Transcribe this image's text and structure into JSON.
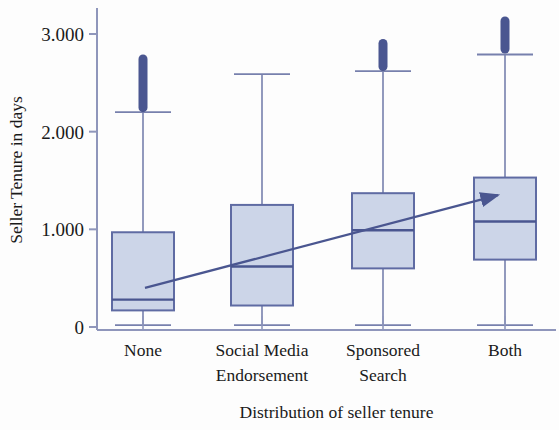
{
  "chart_data": {
    "type": "box",
    "title": "",
    "xlabel": "Distribution of seller tenure",
    "ylabel": "Seller Tenure in days",
    "categories": [
      "None",
      "Social Media Endorsement",
      "Sponsored Search",
      "Both"
    ],
    "category_lines": [
      [
        "None"
      ],
      [
        "Social Media",
        "Endorsement"
      ],
      [
        "Sponsored",
        "Search"
      ],
      [
        "Both"
      ]
    ],
    "ylim": [
      0,
      3200
    ],
    "yticks": [
      0,
      1000,
      2000,
      3000
    ],
    "ytick_labels": [
      "0",
      "1.000",
      "2.000",
      "3.000"
    ],
    "grid": false,
    "legend": "none",
    "boxes": [
      {
        "category": "None",
        "whisker_low": 20,
        "q1": 170,
        "median": 280,
        "q3": 970,
        "whisker_high": 2200,
        "outlier_min": 2200,
        "outlier_max": 2790
      },
      {
        "category": "Social Media Endorsement",
        "whisker_low": 20,
        "q1": 220,
        "median": 620,
        "q3": 1250,
        "whisker_high": 2590,
        "outlier_min": null,
        "outlier_max": null
      },
      {
        "category": "Sponsored Search",
        "whisker_low": 20,
        "q1": 600,
        "median": 990,
        "q3": 1370,
        "whisker_high": 2620,
        "outlier_min": 2620,
        "outlier_max": 2950
      },
      {
        "category": "Both",
        "whisker_low": 20,
        "q1": 690,
        "median": 1080,
        "q3": 1530,
        "whisker_high": 2790,
        "outlier_min": 2800,
        "outlier_max": 3180
      }
    ],
    "annotations": [
      {
        "kind": "trend-arrow",
        "from_category": "None",
        "to_category": "Both",
        "from_value": 400,
        "to_value": 1350,
        "direction": "upward"
      }
    ],
    "colors": {
      "box_fill": "#ccd5e8",
      "box_stroke": "#5f6ba3",
      "median_line": "#4a5690",
      "whisker": "#7780ad",
      "outlier": "#4a5690",
      "arrow": "#4a5690",
      "axis": "#8f96bb",
      "text": "#1a1a1a",
      "background": "#fdfdfd"
    }
  }
}
